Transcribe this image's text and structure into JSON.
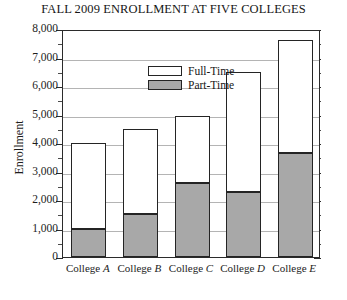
{
  "chart_data": {
    "type": "bar",
    "subtype": "stacked-vertical",
    "title": "FALL 2009 ENROLLMENT AT FIVE COLLEGES",
    "xlabel": "",
    "ylabel": "Enrollment",
    "ylim": [
      0,
      8000
    ],
    "ytick_step": 1000,
    "yminor_step": 500,
    "grid": "horizontal",
    "legend_position": "inside-top-left",
    "categories": [
      "College A",
      "College B",
      "College C",
      "College D",
      "College E"
    ],
    "category_prefix": "College",
    "category_letters": [
      "A",
      "B",
      "C",
      "D",
      "E"
    ],
    "series": [
      {
        "name": "Part-Time",
        "color": "#a8a8a8",
        "values": [
          1000,
          1500,
          2600,
          2300,
          3650
        ]
      },
      {
        "name": "Full-Time",
        "color": "#ffffff",
        "values": [
          3000,
          3000,
          2350,
          4200,
          3950
        ]
      }
    ],
    "totals": [
      4000,
      4500,
      4950,
      6500,
      7600
    ],
    "ytick_labels": [
      "8,000",
      "7,000",
      "6,000",
      "5,000",
      "4,000",
      "3,000",
      "2,000",
      "1,000",
      "0"
    ],
    "ytick_values": [
      8000,
      7000,
      6000,
      5000,
      4000,
      3000,
      2000,
      1000,
      0
    ]
  },
  "legend": {
    "items": [
      {
        "label": "Full-Time",
        "swatch": "white"
      },
      {
        "label": "Part-Time",
        "swatch": "gray"
      }
    ]
  },
  "axis": {
    "y_title": "Enrollment",
    "zero_label": "0"
  },
  "colors": {
    "part_time_fill": "#a8a8a8",
    "full_time_fill": "#ffffff",
    "bar_outline": "#242424",
    "gridline": "#b4b4b4",
    "frame": "#2b2b2b"
  }
}
